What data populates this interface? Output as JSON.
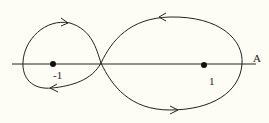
{
  "diagram": {
    "axis_label": "A",
    "points": [
      {
        "label": "-1",
        "x": 53,
        "y": 64
      },
      {
        "label": "1",
        "x": 204,
        "y": 65
      }
    ],
    "colors": {
      "background": "#fdfdf5",
      "stroke": "#222222"
    }
  }
}
